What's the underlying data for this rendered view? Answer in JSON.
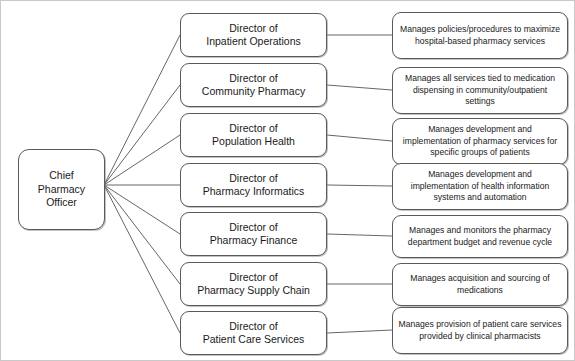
{
  "diagram": {
    "type": "org-chart",
    "colors": {
      "background": "#ffffff",
      "box_border": "#5a5a5a",
      "connector": "#555555",
      "text": "#1a1a1a",
      "image_border": "#c9c9c9"
    },
    "root": {
      "label": "Chief\nPharmacy\nOfficer"
    },
    "branches": [
      {
        "role": "Director of\nInpatient Operations",
        "description": "Manages policies/procedures to maximize hospital-based pharmacy services"
      },
      {
        "role": "Director of\nCommunity Pharmacy",
        "description": "Manages all services tied to medication dispensing in community/outpatient settings"
      },
      {
        "role": "Director of\nPopulation Health",
        "description": "Manages development and implementation of pharmacy services for specific groups of patients"
      },
      {
        "role": "Director of\nPharmacy Informatics",
        "description": "Manages development and implementation of health information systems and automation"
      },
      {
        "role": "Director of\nPharmacy Finance",
        "description": "Manages and monitors the pharmacy department budget and revenue cycle"
      },
      {
        "role": "Director of\nPharmacy Supply Chain",
        "description": "Manages acquisition and sourcing of medications"
      },
      {
        "role": "Director of\nPatient Care Services",
        "description": "Manages provision of patient care services provided by clinical pharmacists"
      }
    ]
  }
}
